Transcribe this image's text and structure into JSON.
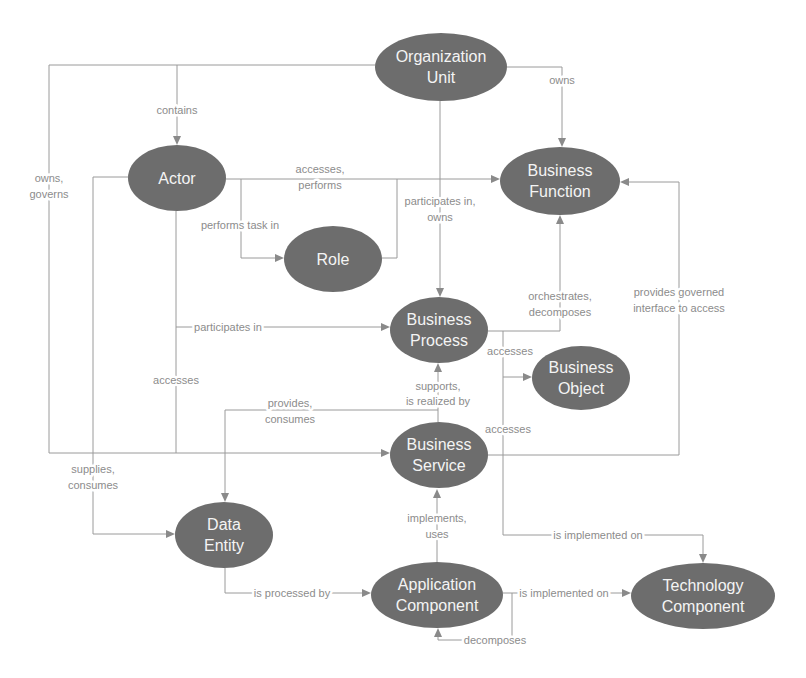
{
  "nodes": {
    "organization_unit": {
      "line1": "Organization",
      "line2": "Unit"
    },
    "actor": {
      "line1": "Actor"
    },
    "business_function": {
      "line1": "Business",
      "line2": "Function"
    },
    "role": {
      "line1": "Role"
    },
    "business_process": {
      "line1": "Business",
      "line2": "Process"
    },
    "business_object": {
      "line1": "Business",
      "line2": "Object"
    },
    "business_service": {
      "line1": "Business",
      "line2": "Service"
    },
    "data_entity": {
      "line1": "Data",
      "line2": "Entity"
    },
    "application_component": {
      "line1": "Application",
      "line2": "Component"
    },
    "technology_component": {
      "line1": "Technology",
      "line2": "Component"
    }
  },
  "edge_labels": {
    "owns_governs": {
      "line1": "owns,",
      "line2": "governs"
    },
    "contains": {
      "line1": "contains"
    },
    "owns": {
      "line1": "owns"
    },
    "participates_in_owns": {
      "line1": "participates in,",
      "line2": "owns"
    },
    "accesses_performs": {
      "line1": "accesses,",
      "line2": "performs"
    },
    "performs_task_in": {
      "line1": "performs task in"
    },
    "supplies_consumes": {
      "line1": "supplies,",
      "line2": "consumes"
    },
    "actor_accesses": {
      "line1": "accesses"
    },
    "actor_participates_in": {
      "line1": "participates in"
    },
    "orchestrates_decomposes": {
      "line1": "orchestrates,",
      "line2": "decomposes"
    },
    "process_accesses_object": {
      "line1": "accesses"
    },
    "service_accesses": {
      "line1": "accesses"
    },
    "process_implemented_on": {
      "line1": "is implemented on"
    },
    "provides_governed_interface": {
      "line1": "provides governed",
      "line2": "interface to access"
    },
    "supports_realized_by": {
      "line1": "supports,",
      "line2": "is realized by"
    },
    "provides_consumes": {
      "line1": "provides,",
      "line2": "consumes"
    },
    "implements_uses": {
      "line1": "implements,",
      "line2": "uses"
    },
    "is_processed_by": {
      "line1": "is processed by"
    },
    "app_implemented_on": {
      "line1": "is implemented on"
    },
    "decomposes": {
      "line1": "decomposes"
    }
  },
  "relationships": [
    {
      "from": "Organization Unit",
      "to": "Business Service",
      "label": "owns, governs"
    },
    {
      "from": "Organization Unit",
      "to": "Actor",
      "label": "contains"
    },
    {
      "from": "Organization Unit",
      "to": "Business Function",
      "label": "owns"
    },
    {
      "from": "Organization Unit",
      "to": "Business Process",
      "label": "participates in, owns"
    },
    {
      "from": "Actor",
      "to": "Business Function",
      "label": "accesses, performs"
    },
    {
      "from": "Actor",
      "to": "Role",
      "label": "performs task in"
    },
    {
      "from": "Actor",
      "to": "Data Entity",
      "label": "supplies, consumes"
    },
    {
      "from": "Actor",
      "to": "Business Service",
      "label": "accesses"
    },
    {
      "from": "Actor",
      "to": "Business Process",
      "label": "participates in"
    },
    {
      "from": "Business Process",
      "to": "Business Function",
      "label": "orchestrates, decomposes"
    },
    {
      "from": "Business Process",
      "to": "Business Object",
      "label": "accesses"
    },
    {
      "from": "Business Service",
      "to": "Technology Component",
      "label": "accesses / is implemented on"
    },
    {
      "from": "Business Service",
      "to": "Business Function",
      "label": "provides governed interface to access"
    },
    {
      "from": "Business Service",
      "to": "Business Process",
      "label": "supports, is realized by"
    },
    {
      "from": "Business Service",
      "to": "Data Entity",
      "label": "provides, consumes"
    },
    {
      "from": "Application Component",
      "to": "Business Service",
      "label": "implements, uses"
    },
    {
      "from": "Data Entity",
      "to": "Application Component",
      "label": "is processed by"
    },
    {
      "from": "Application Component",
      "to": "Technology Component",
      "label": "is implemented on"
    },
    {
      "from": "Application Component",
      "to": "Application Component",
      "label": "decomposes"
    }
  ],
  "colors": {
    "node_fill": "#6d6d6d",
    "node_text": "#f4f4f4",
    "edge": "#9a9a9a",
    "label": "#8c8c8c",
    "background": "#ffffff"
  }
}
